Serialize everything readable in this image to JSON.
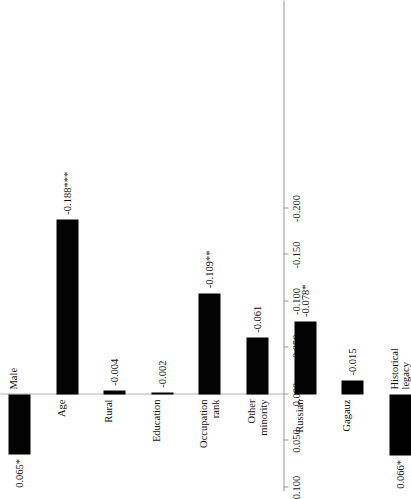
{
  "chart_data": {
    "type": "bar",
    "orientation": "vertical-rendered-rotated",
    "title": "",
    "xlabel": "",
    "ylabel": "",
    "ylim": [
      -0.225,
      0.1
    ],
    "grid": false,
    "legend": null,
    "axis_ticks": [
      "0.100",
      "0.050",
      "0.000",
      "-0.050",
      "-0.100",
      "-0.150",
      "-0.200"
    ],
    "axis_tick_values": [
      0.1,
      0.05,
      0.0,
      -0.05,
      -0.1,
      -0.15,
      -0.2
    ],
    "categories": [
      "Male",
      "Age",
      "Rural",
      "Education",
      "Occupation\nrank",
      "Other\nminority",
      "Russian",
      "Gagauz",
      "Historical\nlegacy"
    ],
    "values": [
      0.065,
      -0.188,
      -0.004,
      -0.002,
      -0.109,
      -0.061,
      -0.078,
      -0.015,
      0.066
    ],
    "data_labels": [
      "0.065*",
      "-0.188***",
      "-0.004",
      "-0.002",
      "-0.109**",
      "-0.061",
      "-0.078*",
      "-0.015",
      "0.066*"
    ],
    "significance": [
      "*",
      "***",
      "",
      "",
      "**",
      "",
      "*",
      "",
      "*"
    ],
    "bar_color": "#000000",
    "axis_color": "#9a9a9a"
  }
}
